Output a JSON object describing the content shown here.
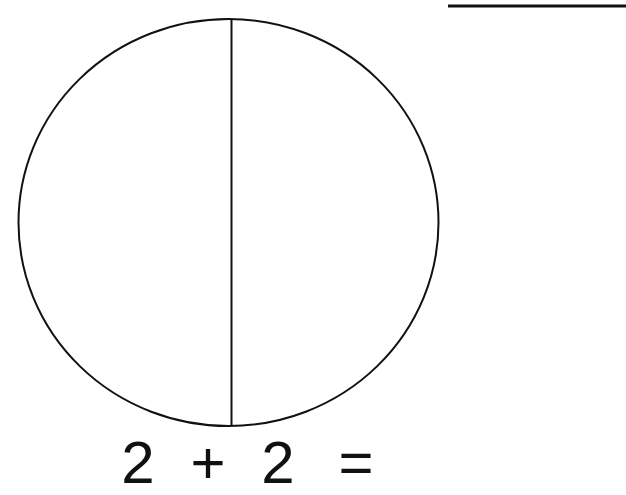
{
  "worksheet": {
    "title": "Fraction circle addition worksheet",
    "background_color": "#ffffff",
    "ink_color": "#111111",
    "width": 626,
    "height": 495
  },
  "answer_line": {
    "name": "answer-blank-line",
    "description": "horizontal rule for writing the answer",
    "x_start": 448,
    "x_end": 626,
    "y": 6,
    "thickness": 3,
    "color": "#111111"
  },
  "figure": {
    "shape": "circle",
    "center_x": 228,
    "center_y": 222,
    "radius_x": 210,
    "radius_y": 203,
    "stroke_width": 2,
    "stroke_color": "#111111",
    "fill": "none",
    "divider": {
      "name": "vertical-divider",
      "orientation": "vertical",
      "x": 231,
      "y_start": 19,
      "y_end": 425,
      "stroke_width": 2,
      "stroke_color": "#111111"
    },
    "parts_total": 2,
    "parts_shaded": 0
  },
  "equation": {
    "full_text": "2 + 2 =",
    "left_operand": "2",
    "operator": "+",
    "right_operand": "2",
    "equals": "=",
    "answer": "",
    "font_size_px": 60,
    "color": "#111111"
  }
}
